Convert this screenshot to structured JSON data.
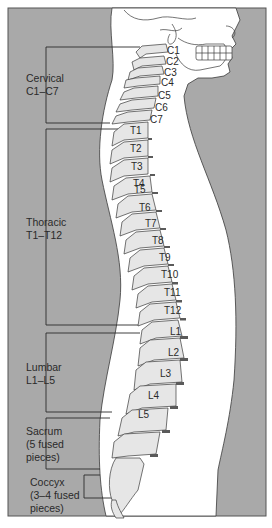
{
  "diagram": {
    "colors": {
      "background": "#a9a9a9",
      "body": "#ffffff",
      "bone": "#e6e6e6",
      "disc": "#5a5a5a",
      "outline": "#3a3a3a",
      "text": "#2a2a2a"
    },
    "regions": [
      {
        "id": "cervical",
        "line1": "Cervical",
        "line2": "C1–C7"
      },
      {
        "id": "thoracic",
        "line1": "Thoracic",
        "line2": "T1–T12"
      },
      {
        "id": "lumbar",
        "line1": "Lumbar",
        "line2": "L1–L5"
      },
      {
        "id": "sacrum",
        "line1": "Sacrum",
        "line2": "(5 fused",
        "line3": "pieces)"
      },
      {
        "id": "coccyx",
        "line1": "Coccyx",
        "line2": "(3–4 fused",
        "line3": "pieces)"
      }
    ],
    "vertebrae": {
      "cervical": [
        "C1",
        "C2",
        "C3",
        "C4",
        "C5",
        "C6",
        "C7"
      ],
      "thoracic": [
        "T1",
        "T2",
        "T3",
        "T4",
        "T5",
        "T6",
        "T7",
        "T8",
        "T9",
        "T10",
        "T11",
        "T12"
      ],
      "lumbar": [
        "L1",
        "L2",
        "L3",
        "L4",
        "L5"
      ]
    }
  }
}
